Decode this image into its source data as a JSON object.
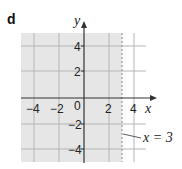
{
  "part_label": "d",
  "axes": {
    "x_label": "x",
    "y_label": "y",
    "x_ticks": [
      "-4",
      "-2",
      "0",
      "2",
      "4"
    ],
    "y_ticks": [
      "4",
      "2",
      "-2",
      "-4"
    ],
    "origin_label": "0"
  },
  "boundary": {
    "label": "x = 3",
    "style": "dashed",
    "x_value": 3
  },
  "shading": {
    "region": "x < 3",
    "color": "#e6e6e6"
  },
  "colors": {
    "grid": "#b5b5b5",
    "axis": "#333333",
    "boundary": "#999999"
  }
}
